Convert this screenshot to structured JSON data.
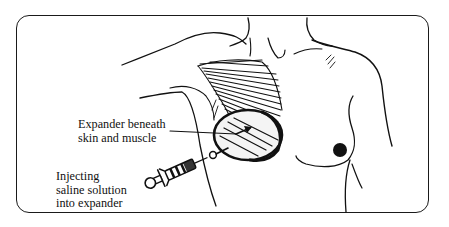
{
  "figure": {
    "type": "medical-illustration",
    "line_color": "#111111",
    "background": "#ffffff"
  },
  "labels": {
    "expander": {
      "line1": "Expander beneath",
      "line2": "skin and muscle"
    },
    "injection": {
      "line1": "Injecting",
      "line2": "saline solution",
      "line3": "into expander"
    }
  }
}
